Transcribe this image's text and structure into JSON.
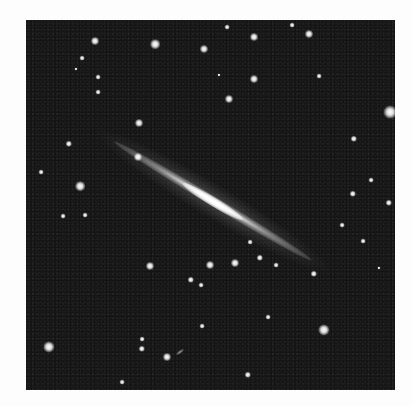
{
  "image": {
    "subject": "edge-on spiral galaxy in star field",
    "background_color": "#141414",
    "border_color": "#fdfdfd",
    "galaxy": {
      "angle_deg": 31
    },
    "stars": [
      {
        "x": 69,
        "y": 21,
        "s": 5
      },
      {
        "x": 129,
        "y": 24,
        "s": 6
      },
      {
        "x": 178,
        "y": 29,
        "s": 5
      },
      {
        "x": 56,
        "y": 38,
        "s": 3
      },
      {
        "x": 50,
        "y": 49,
        "s": 2
      },
      {
        "x": 72,
        "y": 57,
        "s": 3
      },
      {
        "x": 72,
        "y": 72,
        "s": 3
      },
      {
        "x": 113,
        "y": 103,
        "s": 5
      },
      {
        "x": 43,
        "y": 124,
        "s": 4
      },
      {
        "x": 112,
        "y": 137,
        "s": 5
      },
      {
        "x": 54,
        "y": 166,
        "s": 6
      },
      {
        "x": 15,
        "y": 152,
        "s": 3
      },
      {
        "x": 228,
        "y": 17,
        "s": 5
      },
      {
        "x": 283,
        "y": 14,
        "s": 5
      },
      {
        "x": 266,
        "y": 5,
        "s": 3
      },
      {
        "x": 201,
        "y": 7,
        "s": 3
      },
      {
        "x": 228,
        "y": 59,
        "s": 5
      },
      {
        "x": 203,
        "y": 79,
        "s": 5
      },
      {
        "x": 193,
        "y": 55,
        "s": 2
      },
      {
        "x": 293,
        "y": 56,
        "s": 3
      },
      {
        "x": 364,
        "y": 92,
        "s": 8
      },
      {
        "x": 328,
        "y": 119,
        "s": 4
      },
      {
        "x": 345,
        "y": 160,
        "s": 3
      },
      {
        "x": 327,
        "y": 174,
        "s": 4
      },
      {
        "x": 363,
        "y": 183,
        "s": 4
      },
      {
        "x": 37,
        "y": 196,
        "s": 3
      },
      {
        "x": 59,
        "y": 195,
        "s": 3
      },
      {
        "x": 124,
        "y": 246,
        "s": 5
      },
      {
        "x": 165,
        "y": 260,
        "s": 4
      },
      {
        "x": 175,
        "y": 265,
        "s": 3
      },
      {
        "x": 23,
        "y": 327,
        "s": 7
      },
      {
        "x": 116,
        "y": 329,
        "s": 4
      },
      {
        "x": 116,
        "y": 319,
        "s": 3
      },
      {
        "x": 141,
        "y": 337,
        "s": 5
      },
      {
        "x": 176,
        "y": 306,
        "s": 3
      },
      {
        "x": 96,
        "y": 362,
        "s": 3
      },
      {
        "x": 184,
        "y": 245,
        "s": 5
      },
      {
        "x": 209,
        "y": 243,
        "s": 5
      },
      {
        "x": 234,
        "y": 238,
        "s": 4
      },
      {
        "x": 250,
        "y": 245,
        "s": 3
      },
      {
        "x": 224,
        "y": 222,
        "s": 3
      },
      {
        "x": 288,
        "y": 254,
        "s": 4
      },
      {
        "x": 316,
        "y": 205,
        "s": 3
      },
      {
        "x": 337,
        "y": 221,
        "s": 3
      },
      {
        "x": 298,
        "y": 310,
        "s": 7
      },
      {
        "x": 242,
        "y": 297,
        "s": 3
      },
      {
        "x": 222,
        "y": 355,
        "s": 4
      },
      {
        "x": 353,
        "y": 248,
        "s": 2
      }
    ],
    "streaks": [
      {
        "x": 154,
        "y": 332
      }
    ]
  }
}
